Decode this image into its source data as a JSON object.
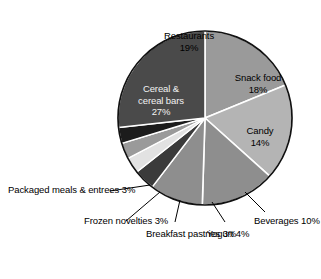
{
  "chart_data": {
    "type": "pie",
    "title": "",
    "subtitle": "",
    "xlabel": "",
    "ylabel": "",
    "legend_position": "none",
    "grid": false,
    "units": "percent",
    "categories": [
      "Restaurants",
      "Snack food",
      "Candy",
      "Beverages",
      "Yogurt",
      "Breakfast pastries",
      "Frozen novelties",
      "Packaged meals & entrees",
      "Cereal & cereal bars"
    ],
    "values": [
      19,
      18,
      14,
      10,
      4,
      3,
      3,
      3,
      27
    ],
    "slices": [
      {
        "name": "Restaurants",
        "label": "Restaurants",
        "value": 19,
        "value_text": "19%",
        "color": "#9a9a9a",
        "label_placement": "inside"
      },
      {
        "name": "Snack food",
        "label": "Snack food",
        "value": 18,
        "value_text": "18%",
        "color": "#b4b4b4",
        "label_placement": "inside"
      },
      {
        "name": "Candy",
        "label": "Candy",
        "value": 14,
        "value_text": "14%",
        "color": "#8e8e8e",
        "label_placement": "inside"
      },
      {
        "name": "Beverages",
        "label": "Beverages",
        "value": 10,
        "value_text": "10%",
        "color": "#8e8e8e",
        "label_placement": "callout"
      },
      {
        "name": "Yogurt",
        "label": "Yogurt",
        "value": 4,
        "value_text": "4%",
        "color": "#3b3b3b",
        "label_placement": "callout"
      },
      {
        "name": "Breakfast pastries",
        "label": "Breakfast pastries",
        "value": 3,
        "value_text": "3%",
        "color": "#e2e2e2",
        "label_placement": "callout"
      },
      {
        "name": "Frozen novelties",
        "label": "Frozen novelties",
        "value": 3,
        "value_text": "3%",
        "color": "#9a9a9a",
        "label_placement": "callout"
      },
      {
        "name": "Packaged meals & entrees",
        "label": "Packaged meals & entrees",
        "value": 3,
        "value_text": "3%",
        "color": "#1c1c1c",
        "label_placement": "callout"
      },
      {
        "name": "Cereal & cereal bars",
        "label": "Cereal & cereal bars",
        "value": 27,
        "value_text": "27%",
        "color": "#4a4a4a",
        "label_placement": "inside"
      }
    ]
  },
  "labels": {
    "restaurants": {
      "line1": "Restaurants",
      "pct": "19%"
    },
    "snack_food": {
      "line1": "Snack food",
      "pct": "18%"
    },
    "candy": {
      "line1": "Candy",
      "pct": "14%"
    },
    "cereal": {
      "line1": "Cereal &",
      "line2": "cereal bars",
      "pct": "27%"
    },
    "packaged_meals": {
      "line1": "Packaged meals",
      "line2": "& entrees",
      "pct": "3%"
    },
    "frozen_novelties": {
      "line1": "Frozen",
      "line2": "novelties",
      "pct": "3%"
    },
    "breakfast_pastries": {
      "line1": "Breakfast",
      "line2": "pastries",
      "pct": "3%"
    },
    "yogurt": {
      "line1": "Yogurt",
      "pct": "4%"
    },
    "beverages": {
      "line1": "Beverages",
      "pct": "10%"
    }
  },
  "style": {
    "background": "#ffffff",
    "outline": "#000000",
    "divider": "#ffffff",
    "leader_line": "#000000"
  }
}
